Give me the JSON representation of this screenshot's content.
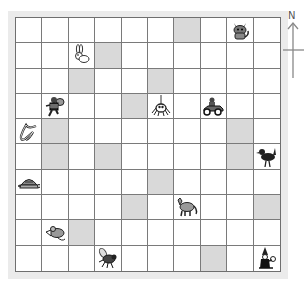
{
  "compass": {
    "label": "N"
  },
  "grid": {
    "rows": 10,
    "cols": 10,
    "shade_color": "#d9d9d9",
    "shaded_cells": [
      [
        0,
        6
      ],
      [
        1,
        3
      ],
      [
        2,
        2
      ],
      [
        2,
        5
      ],
      [
        3,
        4
      ],
      [
        4,
        1
      ],
      [
        4,
        8
      ],
      [
        5,
        1
      ],
      [
        5,
        3
      ],
      [
        5,
        8
      ],
      [
        6,
        5
      ],
      [
        7,
        4
      ],
      [
        7,
        9
      ],
      [
        8,
        2
      ],
      [
        9,
        7
      ]
    ],
    "items": [
      {
        "row": 0,
        "col": 8,
        "name": "cat",
        "icon": "cat-icon"
      },
      {
        "row": 1,
        "col": 2,
        "name": "rabbit",
        "icon": "rabbit-icon"
      },
      {
        "row": 3,
        "col": 1,
        "name": "robber",
        "icon": "robber-icon"
      },
      {
        "row": 3,
        "col": 5,
        "name": "spider",
        "icon": "spider-icon"
      },
      {
        "row": 3,
        "col": 7,
        "name": "race car",
        "icon": "race-car-icon"
      },
      {
        "row": 4,
        "col": 0,
        "name": "snake",
        "icon": "snake-icon"
      },
      {
        "row": 5,
        "col": 9,
        "name": "bird",
        "icon": "bird-icon"
      },
      {
        "row": 6,
        "col": 0,
        "name": "tortoise",
        "icon": "tortoise-icon"
      },
      {
        "row": 7,
        "col": 6,
        "name": "wolf",
        "icon": "wolf-icon"
      },
      {
        "row": 8,
        "col": 1,
        "name": "mouse",
        "icon": "mouse-icon"
      },
      {
        "row": 9,
        "col": 3,
        "name": "fly",
        "icon": "fly-icon"
      },
      {
        "row": 9,
        "col": 9,
        "name": "wizard",
        "icon": "wizard-icon"
      }
    ]
  }
}
